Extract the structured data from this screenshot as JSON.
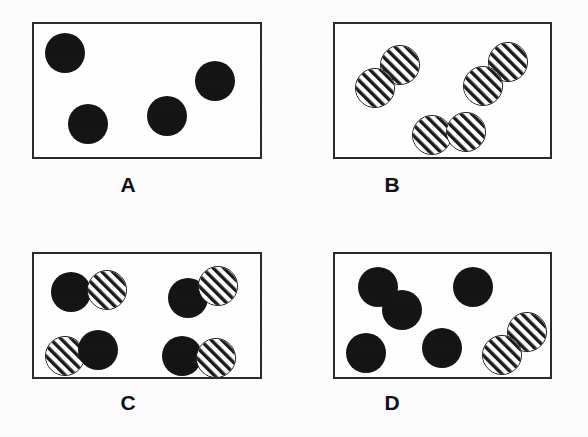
{
  "figure": {
    "width": 588,
    "height": 437,
    "background_color": "#fdfdfd",
    "box_border_color": "#2b2b2b",
    "solid_circle_color": "#151515",
    "hatch_line_color": "#1a1a1a",
    "hatch_background_color": "#ffffff",
    "label_color": "#111111",
    "circle_radius": 19,
    "hatch_direction": "forward-slash-diagonal"
  },
  "panels": [
    {
      "id": "A",
      "label": "A",
      "box": {
        "x": 32,
        "y": 22,
        "w": 230,
        "h": 137
      },
      "label_pos": {
        "x": 108,
        "y": 174,
        "w": 40
      },
      "description": "four separate solid circles",
      "counts": {
        "solid": 4,
        "hatched": 0,
        "pairs": 0,
        "singles": 4
      },
      "circles": [
        {
          "fill": "solid",
          "cx": 63,
          "cy": 51,
          "r": 20
        },
        {
          "fill": "solid",
          "cx": 86,
          "cy": 122,
          "r": 20
        },
        {
          "fill": "solid",
          "cx": 165,
          "cy": 114,
          "r": 20
        },
        {
          "fill": "solid",
          "cx": 213,
          "cy": 79,
          "r": 20
        }
      ]
    },
    {
      "id": "B",
      "label": "B",
      "box": {
        "x": 333,
        "y": 22,
        "w": 219,
        "h": 137
      },
      "label_pos": {
        "x": 372,
        "y": 174,
        "w": 40
      },
      "description": "three diatomic pairs of hatched circles",
      "counts": {
        "solid": 0,
        "hatched": 6,
        "pairs": 3,
        "singles": 0
      },
      "circles": [
        {
          "fill": "hatched",
          "cx": 398,
          "cy": 63,
          "r": 20
        },
        {
          "fill": "hatched",
          "cx": 373,
          "cy": 86,
          "r": 20
        },
        {
          "fill": "hatched",
          "cx": 506,
          "cy": 60,
          "r": 20
        },
        {
          "fill": "hatched",
          "cx": 481,
          "cy": 84,
          "r": 20
        },
        {
          "fill": "hatched",
          "cx": 430,
          "cy": 133,
          "r": 20
        },
        {
          "fill": "hatched",
          "cx": 464,
          "cy": 130,
          "r": 20
        }
      ]
    },
    {
      "id": "C",
      "label": "C",
      "box": {
        "x": 32,
        "y": 252,
        "w": 230,
        "h": 127
      },
      "label_pos": {
        "x": 108,
        "y": 392,
        "w": 40
      },
      "description": "four pairs, each one solid circle bonded to one hatched circle",
      "counts": {
        "solid": 4,
        "hatched": 4,
        "pairs": 4,
        "singles": 0
      },
      "circles": [
        {
          "fill": "solid",
          "cx": 69,
          "cy": 290,
          "r": 20
        },
        {
          "fill": "hatched",
          "cx": 105,
          "cy": 288,
          "r": 20
        },
        {
          "fill": "solid",
          "cx": 186,
          "cy": 296,
          "r": 20
        },
        {
          "fill": "hatched",
          "cx": 216,
          "cy": 284,
          "r": 20
        },
        {
          "fill": "hatched",
          "cx": 63,
          "cy": 354,
          "r": 20
        },
        {
          "fill": "solid",
          "cx": 96,
          "cy": 348,
          "r": 20
        },
        {
          "fill": "solid",
          "cx": 180,
          "cy": 354,
          "r": 20
        },
        {
          "fill": "hatched",
          "cx": 214,
          "cy": 356,
          "r": 20
        }
      ]
    },
    {
      "id": "D",
      "label": "D",
      "box": {
        "x": 333,
        "y": 252,
        "w": 219,
        "h": 127
      },
      "label_pos": {
        "x": 372,
        "y": 392,
        "w": 40
      },
      "description": "one solid pair, three separate solid circles, and one hatched pair",
      "counts": {
        "solid": 5,
        "hatched": 2,
        "pairs": 2,
        "singles": 3
      },
      "circles": [
        {
          "fill": "solid",
          "cx": 376,
          "cy": 285,
          "r": 20
        },
        {
          "fill": "solid",
          "cx": 400,
          "cy": 308,
          "r": 20
        },
        {
          "fill": "solid",
          "cx": 471,
          "cy": 285,
          "r": 20
        },
        {
          "fill": "solid",
          "cx": 364,
          "cy": 351,
          "r": 20
        },
        {
          "fill": "solid",
          "cx": 440,
          "cy": 346,
          "r": 20
        },
        {
          "fill": "hatched",
          "cx": 525,
          "cy": 330,
          "r": 20
        },
        {
          "fill": "hatched",
          "cx": 500,
          "cy": 353,
          "r": 20
        }
      ]
    }
  ]
}
